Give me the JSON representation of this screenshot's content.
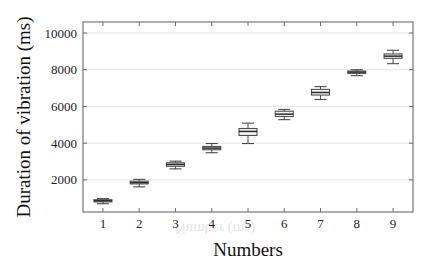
{
  "chart_data": {
    "type": "box",
    "title": "",
    "xlabel": "Numbers",
    "ylabel": "Duration of vibration (ms)",
    "categories": [
      "1",
      "2",
      "3",
      "4",
      "5",
      "6",
      "7",
      "8",
      "9"
    ],
    "xtick_labels": [
      "1",
      "2",
      "3",
      "4",
      "5",
      "6",
      "7",
      "8",
      "9"
    ],
    "ytick_labels": [
      "2000",
      "4000",
      "6000",
      "8000",
      "10000"
    ],
    "ytick_values": [
      2000,
      4000,
      6000,
      8000,
      10000
    ],
    "ylim": [
      250,
      10600
    ],
    "xlim": [
      0.45,
      9.55
    ],
    "grid": "horizontal",
    "legend": "none",
    "boxes": [
      {
        "category": "1",
        "whisker_low": 700,
        "q1": 800,
        "median": 860,
        "q3": 920,
        "whisker_high": 980
      },
      {
        "category": "2",
        "whisker_low": 1620,
        "q1": 1780,
        "median": 1850,
        "q3": 1930,
        "whisker_high": 2030
      },
      {
        "category": "3",
        "whisker_low": 2600,
        "q1": 2740,
        "median": 2840,
        "q3": 2930,
        "whisker_high": 3020
      },
      {
        "category": "4",
        "whisker_low": 3480,
        "q1": 3640,
        "median": 3730,
        "q3": 3820,
        "whisker_high": 3980
      },
      {
        "category": "5",
        "whisker_low": 3980,
        "q1": 4420,
        "median": 4640,
        "q3": 4800,
        "whisker_high": 5090
      },
      {
        "category": "6",
        "whisker_low": 5280,
        "q1": 5450,
        "median": 5580,
        "q3": 5740,
        "whisker_high": 5840
      },
      {
        "category": "7",
        "whisker_low": 6380,
        "q1": 6620,
        "median": 6760,
        "q3": 6930,
        "whisker_high": 7080
      },
      {
        "category": "8",
        "whisker_low": 7680,
        "q1": 7800,
        "median": 7870,
        "q3": 7930,
        "whisker_high": 8000
      },
      {
        "category": "9",
        "whisker_low": 8330,
        "q1": 8620,
        "median": 8740,
        "q3": 8860,
        "whisker_high": 9060
      }
    ]
  },
  "style": {
    "box_fill": "#f2f2f2",
    "box_stroke": "#4a4a4a",
    "median_color": "#2a2a2a",
    "grid_color": "#d8d8d8",
    "axis_color": "#6b6b6b",
    "text_color": "#1c1c1c",
    "background": "#ffffff"
  },
  "artifacts": {
    "bleed_text_1": "(ms)",
    "bleed_text_2": "Number"
  }
}
